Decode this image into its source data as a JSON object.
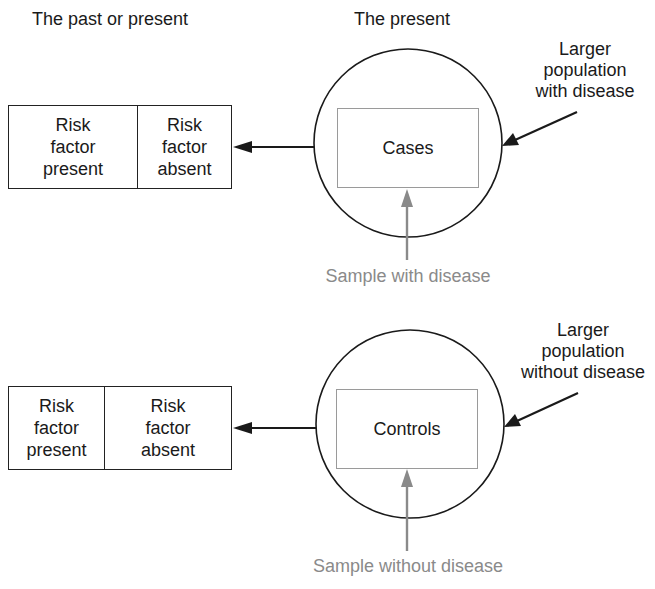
{
  "headings": {
    "left": "The past or present",
    "right": "The present"
  },
  "panels": [
    {
      "id": "cases",
      "table": {
        "cells": [
          {
            "label": "Risk factor present",
            "lines": [
              "Risk",
              "factor",
              "present"
            ]
          },
          {
            "label": "Risk factor absent",
            "lines": [
              "Risk",
              "factor",
              "absent"
            ]
          }
        ]
      },
      "inner_box_label": "Cases",
      "population_label": [
        "Larger",
        "population",
        "with disease"
      ],
      "sample_label": "Sample with disease"
    },
    {
      "id": "controls",
      "table": {
        "cells": [
          {
            "label": "Risk factor present",
            "lines": [
              "Risk",
              "factor",
              "present"
            ]
          },
          {
            "label": "Risk factor absent",
            "lines": [
              "Risk",
              "factor",
              "absent"
            ]
          }
        ]
      },
      "inner_box_label": "Controls",
      "population_label": [
        "Larger",
        "population",
        "without disease"
      ],
      "sample_label": "Sample without disease"
    }
  ],
  "colors": {
    "line": "#1a1a1a",
    "sample_gray": "#8a8a8a",
    "inner_box_border": "#9a9a9a"
  }
}
